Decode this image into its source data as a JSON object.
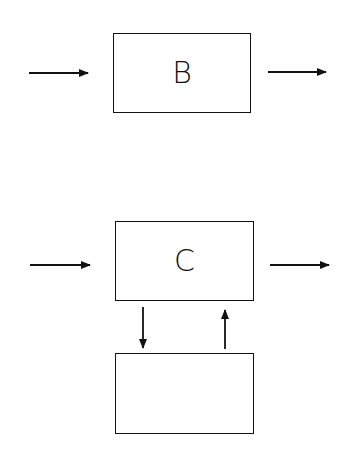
{
  "diagrams": [
    {
      "name": "system-B",
      "block": {
        "label": "B"
      },
      "arrows": [
        {
          "direction": "right",
          "role": "input"
        },
        {
          "direction": "right",
          "role": "output"
        }
      ]
    },
    {
      "name": "system-C-with-feedback",
      "block": {
        "label": "C"
      },
      "feedback_block": {
        "label": ""
      },
      "arrows": [
        {
          "direction": "right",
          "role": "input"
        },
        {
          "direction": "right",
          "role": "output"
        },
        {
          "direction": "down",
          "role": "to-feedback"
        },
        {
          "direction": "up",
          "role": "from-feedback"
        }
      ]
    }
  ],
  "colors": {
    "stroke": "#111111",
    "background": "#ffffff"
  }
}
